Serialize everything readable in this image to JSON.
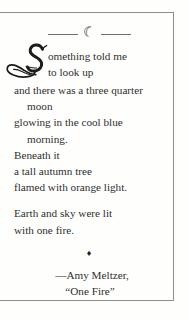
{
  "page": {
    "kind": "printed-book-page",
    "frame_color": "#8e8e8e",
    "background_color": "#fefefd",
    "text_color": "#2e2e2e"
  },
  "ornaments": {
    "moon_divider": {
      "icon": "crescent-moon-icon",
      "glyph": "☾",
      "rule_left": "",
      "rule_right": ""
    },
    "diamond": {
      "icon": "diamond-ornament-icon",
      "glyph": "♦"
    }
  },
  "poem": {
    "dropcap": "S",
    "stanzas": [
      {
        "lines": [
          {
            "text": "omething told me",
            "indent": false
          },
          {
            "text": "to look up",
            "indent": false
          },
          {
            "text": "and there was a three quarter",
            "indent": false
          },
          {
            "text": "moon",
            "indent": true
          },
          {
            "text": "glowing in the cool blue",
            "indent": false
          },
          {
            "text": "morning.",
            "indent": true
          },
          {
            "text": "Beneath it",
            "indent": false
          },
          {
            "text": "a tall autumn tree",
            "indent": false
          },
          {
            "text": "flamed with orange light.",
            "indent": false
          }
        ]
      },
      {
        "lines": [
          {
            "text": "Earth and sky were lit",
            "indent": false
          },
          {
            "text": "with one fire.",
            "indent": false
          }
        ]
      }
    ]
  },
  "attribution": {
    "author": "—Amy Meltzer,",
    "title": "“One Fire”"
  }
}
